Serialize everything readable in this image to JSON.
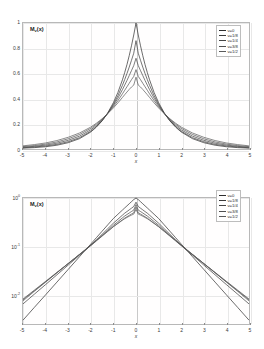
{
  "figure": {
    "background": "#ffffff",
    "axis_color": "#b8b8b8",
    "grid_color": "#e8e8e8",
    "curve_color": "#3a3a3a"
  },
  "chart_data": [
    {
      "type": "line",
      "panel": "top",
      "title": "",
      "xlabel": "x",
      "ylabel": "M_v(x)",
      "ylabel_html": "M<sub>ν</sub>(x)",
      "xlim": [
        -5,
        5
      ],
      "ylim": [
        0,
        1
      ],
      "yscale": "linear",
      "grid": true,
      "legend_position": "upper-right",
      "xticks": [
        "-5",
        "-4",
        "-3",
        "-2",
        "-1",
        "0",
        "1",
        "2",
        "3",
        "4",
        "5"
      ],
      "xtick_values": [
        -5,
        -4,
        -3,
        -2,
        -1,
        0,
        1,
        2,
        3,
        4,
        5
      ],
      "yticks": [
        "0",
        "0.2",
        "0.4",
        "0.6",
        "0.8",
        "1"
      ],
      "ytick_values": [
        0,
        0.2,
        0.4,
        0.6,
        0.8,
        1
      ],
      "x": [
        -5,
        -4.5,
        -4,
        -3.5,
        -3,
        -2.5,
        -2,
        -1.75,
        -1.5,
        -1.25,
        -1,
        -0.8,
        -0.6,
        -0.5,
        -0.4,
        -0.3,
        -0.2,
        -0.1,
        0,
        0.1,
        0.2,
        0.3,
        0.4,
        0.5,
        0.6,
        0.8,
        1,
        1.25,
        1.5,
        1.75,
        2,
        2.5,
        3,
        3.5,
        4,
        4.5,
        5
      ],
      "series": [
        {
          "name": "v=0",
          "color": "#2e2e2e",
          "values": [
            0.007,
            0.011,
            0.018,
            0.03,
            0.05,
            0.082,
            0.135,
            0.174,
            0.223,
            0.287,
            0.368,
            0.449,
            0.549,
            0.607,
            0.67,
            0.741,
            0.819,
            0.905,
            1.0,
            0.905,
            0.819,
            0.741,
            0.67,
            0.607,
            0.549,
            0.449,
            0.368,
            0.287,
            0.223,
            0.174,
            0.135,
            0.082,
            0.05,
            0.03,
            0.018,
            0.011,
            0.007
          ]
        },
        {
          "name": "v=1/8",
          "color": "#3a3a3a",
          "values": [
            0.01,
            0.016,
            0.024,
            0.037,
            0.058,
            0.09,
            0.141,
            0.178,
            0.224,
            0.283,
            0.355,
            0.424,
            0.506,
            0.551,
            0.599,
            0.65,
            0.704,
            0.76,
            0.86,
            0.76,
            0.704,
            0.65,
            0.599,
            0.551,
            0.506,
            0.424,
            0.355,
            0.283,
            0.224,
            0.178,
            0.141,
            0.09,
            0.058,
            0.037,
            0.024,
            0.016,
            0.01
          ]
        },
        {
          "name": "v=1/4",
          "color": "#454545",
          "values": [
            0.014,
            0.021,
            0.031,
            0.046,
            0.069,
            0.102,
            0.152,
            0.187,
            0.23,
            0.283,
            0.346,
            0.404,
            0.471,
            0.507,
            0.544,
            0.583,
            0.622,
            0.662,
            0.72,
            0.662,
            0.622,
            0.583,
            0.544,
            0.507,
            0.471,
            0.404,
            0.346,
            0.283,
            0.23,
            0.187,
            0.152,
            0.102,
            0.069,
            0.046,
            0.031,
            0.021,
            0.014
          ]
        },
        {
          "name": "v=3/8",
          "color": "#505050",
          "values": [
            0.019,
            0.027,
            0.039,
            0.056,
            0.081,
            0.115,
            0.164,
            0.197,
            0.236,
            0.282,
            0.336,
            0.384,
            0.438,
            0.466,
            0.494,
            0.522,
            0.55,
            0.576,
            0.63,
            0.576,
            0.55,
            0.522,
            0.494,
            0.466,
            0.438,
            0.384,
            0.336,
            0.282,
            0.236,
            0.197,
            0.164,
            0.115,
            0.081,
            0.056,
            0.039,
            0.027,
            0.019
          ]
        },
        {
          "name": "v=1/2",
          "color": "#5a5a5a",
          "values": [
            0.025,
            0.035,
            0.048,
            0.067,
            0.093,
            0.127,
            0.174,
            0.205,
            0.24,
            0.281,
            0.326,
            0.366,
            0.409,
            0.431,
            0.452,
            0.473,
            0.492,
            0.507,
            0.57,
            0.507,
            0.492,
            0.473,
            0.452,
            0.431,
            0.409,
            0.366,
            0.326,
            0.281,
            0.24,
            0.205,
            0.174,
            0.127,
            0.093,
            0.067,
            0.048,
            0.035,
            0.025
          ]
        }
      ],
      "legend": [
        {
          "label": "v=0"
        },
        {
          "label": "v=1/8"
        },
        {
          "label": "v=1/4"
        },
        {
          "label": "v=3/8"
        },
        {
          "label": "v=1/2"
        }
      ]
    },
    {
      "type": "line",
      "panel": "bottom",
      "title": "",
      "xlabel": "x",
      "ylabel": "M_v(x)",
      "ylabel_html": "M<sub>ν</sub>(x)",
      "xlim": [
        -5,
        5
      ],
      "ylim": [
        0.0025,
        1.0
      ],
      "yscale": "log",
      "grid": true,
      "legend_position": "upper-right",
      "xticks": [
        "-5",
        "-4",
        "-3",
        "-2",
        "-1",
        "0",
        "1",
        "2",
        "3",
        "4",
        "5"
      ],
      "xtick_values": [
        -5,
        -4,
        -3,
        -2,
        -1,
        0,
        1,
        2,
        3,
        4,
        5
      ],
      "yticks": [
        "10^0",
        "10^-1",
        "10^-2"
      ],
      "ytick_values": [
        1,
        0.1,
        0.01
      ],
      "x": [
        -5,
        -4.5,
        -4,
        -3.5,
        -3,
        -2.5,
        -2,
        -1.75,
        -1.5,
        -1.25,
        -1,
        -0.8,
        -0.6,
        -0.5,
        -0.4,
        -0.3,
        -0.2,
        -0.1,
        0,
        0.1,
        0.2,
        0.3,
        0.4,
        0.5,
        0.6,
        0.8,
        1,
        1.25,
        1.5,
        1.75,
        2,
        2.5,
        3,
        3.5,
        4,
        4.5,
        5
      ],
      "series": [
        {
          "name": "v=0",
          "color": "#2e2e2e",
          "values": [
            0.003,
            0.0055,
            0.01,
            0.0183,
            0.0335,
            0.0613,
            0.112,
            0.152,
            0.206,
            0.279,
            0.378,
            0.462,
            0.564,
            0.623,
            0.688,
            0.76,
            0.84,
            0.928,
            1.0,
            0.928,
            0.84,
            0.76,
            0.688,
            0.623,
            0.564,
            0.462,
            0.378,
            0.279,
            0.206,
            0.152,
            0.112,
            0.0613,
            0.0335,
            0.0183,
            0.01,
            0.0055,
            0.003
          ]
        },
        {
          "name": "v=1/8",
          "color": "#3a3a3a",
          "values": [
            0.0065,
            0.0103,
            0.0163,
            0.0259,
            0.0412,
            0.066,
            0.106,
            0.137,
            0.178,
            0.232,
            0.302,
            0.365,
            0.442,
            0.486,
            0.525,
            0.569,
            0.616,
            0.668,
            0.82,
            0.668,
            0.616,
            0.569,
            0.525,
            0.486,
            0.442,
            0.365,
            0.302,
            0.232,
            0.178,
            0.137,
            0.106,
            0.066,
            0.0412,
            0.0259,
            0.0163,
            0.0103,
            0.0065
          ]
        },
        {
          "name": "v=1/4",
          "color": "#454545",
          "values": [
            0.0079,
            0.0121,
            0.0186,
            0.0286,
            0.044,
            0.068,
            0.105,
            0.133,
            0.169,
            0.215,
            0.274,
            0.326,
            0.389,
            0.424,
            0.456,
            0.49,
            0.526,
            0.562,
            0.73,
            0.562,
            0.526,
            0.49,
            0.456,
            0.424,
            0.389,
            0.326,
            0.274,
            0.215,
            0.169,
            0.133,
            0.105,
            0.068,
            0.044,
            0.0286,
            0.0186,
            0.0121,
            0.0079
          ]
        },
        {
          "name": "v=3/8",
          "color": "#505050",
          "values": [
            0.0082,
            0.0125,
            0.019,
            0.0291,
            0.0444,
            0.0679,
            0.104,
            0.13,
            0.163,
            0.204,
            0.256,
            0.301,
            0.354,
            0.384,
            0.41,
            0.438,
            0.467,
            0.496,
            0.65,
            0.496,
            0.467,
            0.438,
            0.41,
            0.384,
            0.354,
            0.301,
            0.256,
            0.204,
            0.163,
            0.13,
            0.104,
            0.0679,
            0.0444,
            0.0291,
            0.019,
            0.0125,
            0.0082
          ]
        },
        {
          "name": "v=1/2",
          "color": "#5a5a5a",
          "values": [
            0.0075,
            0.0118,
            0.0183,
            0.0285,
            0.0443,
            0.0688,
            0.107,
            0.133,
            0.166,
            0.206,
            0.256,
            0.298,
            0.347,
            0.373,
            0.396,
            0.42,
            0.443,
            0.465,
            0.58,
            0.465,
            0.443,
            0.42,
            0.396,
            0.373,
            0.347,
            0.298,
            0.256,
            0.206,
            0.166,
            0.133,
            0.107,
            0.0688,
            0.0443,
            0.0285,
            0.0183,
            0.0118,
            0.0075
          ]
        }
      ],
      "legend": [
        {
          "label": "v=0"
        },
        {
          "label": "v=1/8"
        },
        {
          "label": "v=1/4"
        },
        {
          "label": "v=3/8"
        },
        {
          "label": "v=1/2"
        }
      ]
    }
  ]
}
